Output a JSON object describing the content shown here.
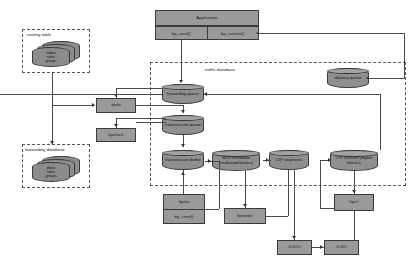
{
  "diagram": {
    "groups": {
      "routing_table": {
        "label": "routing table",
        "disks": [
          "tables",
          "rules",
          "groups"
        ]
      },
      "forwarding_database": {
        "label": "forwarding database",
        "disks": [
          "plans",
          "rules",
          "groups"
        ]
      },
      "traffic_database": {
        "label": "traffic database"
      }
    },
    "application": {
      "title": "Application",
      "api": [
        "bp_send()",
        "bp_receive()"
      ]
    },
    "queues": {
      "forwarding_queue": "forwarding queue",
      "transmission_queue": "transmission queue",
      "transmission_buffer": "transmission buffer",
      "delivery_queue": "delivery queue",
      "sdu_metadata": "SDU metadata (outbound blocks)",
      "ltp_segments": "LTP segments",
      "ltp_session": "LTP session (import blocks)"
    },
    "daemons": {
      "ipnfw": "ipnfw",
      "bpclock": "bpclock",
      "bpclo": "bpclo",
      "bpclo_api": "bp_send()",
      "ltpmeter": "ltpmeter",
      "ltpcli": "ltpcli"
    },
    "link_services": {
      "lso": "<LSO>",
      "lsi": "<LSI>"
    },
    "colors": {
      "box_fill": "#9a9a9a",
      "cylinder_fill": "#8f8f8f",
      "stroke": "#3a3a3a",
      "line": "#4a4a4a",
      "dashed_border": "#555555",
      "background": "#ffffff"
    }
  }
}
